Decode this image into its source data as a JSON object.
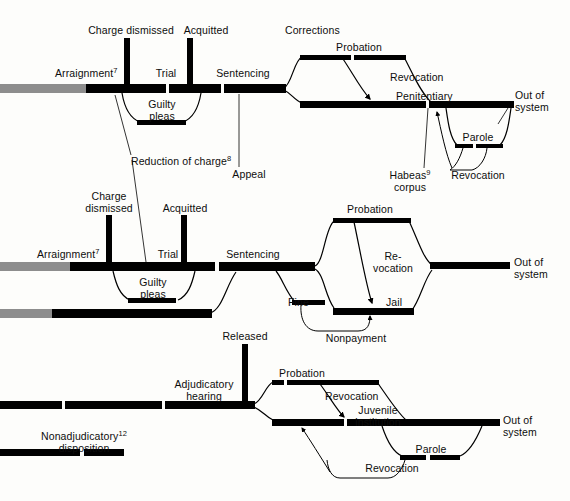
{
  "diagram": {
    "colors": {
      "line": "#000000",
      "entry": "#8d8d8d",
      "background": "#fdfdfb",
      "text": "#0d0d0d"
    },
    "out_of_system_label_line1": "Out of",
    "out_of_system_label_line2": "system"
  },
  "felony_track": {
    "name": "Felony / adult court track",
    "labels": {
      "charge_dismissed": "Charge dismissed",
      "acquitted": "Acquitted",
      "arraignment": "Arraignment",
      "arraignment_note": "7",
      "trial": "Trial",
      "sentencing": "Sentencing",
      "guilty_pleas_line1": "Guilty",
      "guilty_pleas_line2": "pleas",
      "reduction_of_charge": "Reduction of charge",
      "reduction_note": "8",
      "appeal": "Appeal",
      "corrections": "Corrections",
      "probation": "Probation",
      "revocation": "Revocation",
      "penitentiary": "Penitentiary",
      "habeas_line1": "Habeas",
      "habeas_note": "9",
      "habeas_line2": "corpus",
      "parole": "Parole",
      "parole_revocation": "Revocation",
      "out_of_system_1": "Out of",
      "out_of_system_2": "system"
    }
  },
  "misdemeanor_track": {
    "name": "Misdemeanor / lower court track",
    "labels": {
      "charge_dismissed_line1": "Charge",
      "charge_dismissed_line2": "dismissed",
      "acquitted": "Acquitted",
      "arraignment": "Arraignment",
      "arraignment_note": "7",
      "trial": "Trial",
      "sentencing": "Sentencing",
      "guilty_pleas_line1": "Guilty",
      "guilty_pleas_line2": "pleas",
      "probation": "Probation",
      "revocation_line1": "Re-",
      "revocation_line2": "vocation",
      "fine": "Fine",
      "jail": "Jail",
      "nonpayment": "Nonpayment",
      "out_of_system_1": "Out of",
      "out_of_system_2": "system"
    }
  },
  "juvenile_track": {
    "name": "Juvenile track",
    "labels": {
      "released": "Released",
      "adjudicatory_line1": "Adjudicatory",
      "adjudicatory_line2": "hearing",
      "nonadjudicatory_line1": "Nonadjudicatory",
      "nonadjudicatory_note": "12",
      "nonadjudicatory_line2": "disposition",
      "probation": "Probation",
      "revocation": "Revocation",
      "juvenile_institution_line1": "Juvenile",
      "juvenile_institution_line2": "institution",
      "parole": "Parole",
      "parole_revocation": "Revocation",
      "out_of_system_1": "Out of",
      "out_of_system_2": "system"
    }
  }
}
